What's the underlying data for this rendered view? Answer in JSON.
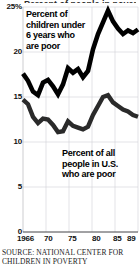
{
  "chart_data": {
    "type": "line",
    "title": "Percent of children under 6 years who are poor",
    "subtitle": "",
    "xlabel": "",
    "ylabel": "",
    "xlim": [
      1966,
      1989
    ],
    "ylim": [
      0,
      25
    ],
    "grid": true,
    "legend_position": "inline-annotation",
    "y_tick_labels": [
      "25%",
      "20",
      "15",
      "10",
      "5",
      "0"
    ],
    "y_tick_values": [
      25,
      20,
      15,
      10,
      5,
      0
    ],
    "x_tick_labels": [
      "1966",
      "70",
      "75",
      "80",
      "85",
      "89"
    ],
    "x_tick_values": [
      1966,
      1970,
      1975,
      1980,
      1985,
      1989
    ],
    "x": [
      1966,
      1967,
      1968,
      1969,
      1970,
      1971,
      1972,
      1973,
      1974,
      1975,
      1976,
      1977,
      1978,
      1979,
      1980,
      1981,
      1982,
      1983,
      1984,
      1985,
      1986,
      1987,
      1988,
      1989
    ],
    "series": [
      {
        "name": "Percent of children under 6 years who are poor",
        "color": "#000000",
        "values": [
          17.6,
          16.8,
          15.6,
          15.2,
          16.6,
          16.9,
          16.2,
          15.3,
          16.4,
          18.2,
          17.7,
          18.1,
          17.2,
          17.9,
          20.3,
          22.0,
          23.3,
          24.6,
          23.4,
          22.6,
          22.0,
          22.4,
          22.1,
          22.5
        ],
        "annotation": "Percent of\nchildren under\n6 years who\nare poor"
      },
      {
        "name": "Percent of all people in U.S. who are poor",
        "color": "#2a2a2a",
        "values": [
          14.7,
          14.2,
          12.8,
          12.1,
          12.6,
          12.5,
          11.9,
          11.1,
          11.2,
          12.3,
          11.8,
          11.6,
          11.4,
          11.7,
          13.0,
          14.0,
          15.0,
          15.2,
          14.4,
          14.0,
          13.6,
          13.4,
          13.0,
          12.8
        ],
        "annotation": "Percent of all\npeople in U.S.\nwho are poor"
      }
    ]
  },
  "axis": {
    "y_ticks": [
      {
        "label": "25%",
        "value": 25,
        "top": 3
      },
      {
        "label": "20",
        "value": 20,
        "top": 48
      },
      {
        "label": "15",
        "value": 15,
        "top": 93
      },
      {
        "label": "10",
        "value": 10,
        "top": 138
      },
      {
        "label": "5",
        "value": 5,
        "top": 183
      },
      {
        "label": "0",
        "value": 0,
        "top": 228
      }
    ],
    "x_ticks": [
      {
        "label": "1966",
        "value": 1966,
        "left": 17
      },
      {
        "label": "70",
        "value": 1970,
        "left": 44
      },
      {
        "label": "75",
        "value": 1975,
        "left": 68
      },
      {
        "label": "80",
        "value": 1980,
        "left": 92
      },
      {
        "label": "85",
        "value": 1985,
        "left": 113
      },
      {
        "label": "89",
        "value": 1989,
        "left": 127
      }
    ]
  },
  "annotations": {
    "children_label": "Percent of\nchildren under\n6 years who\nare poor",
    "all_people_label": "Percent of all\npeople in U.S.\nwho are poor",
    "clipped_headline": "Percent of people in poverty"
  },
  "source": {
    "text": "SOURCE: NATIONAL CENTER FOR\nCHILDREN IN POVERTY"
  },
  "colors": {
    "series_children": "#000000",
    "series_all_people": "#2a2a2a",
    "grid": "#c8c8cc",
    "axis": "#555555",
    "background": "#ffffff",
    "text": "#111111"
  }
}
